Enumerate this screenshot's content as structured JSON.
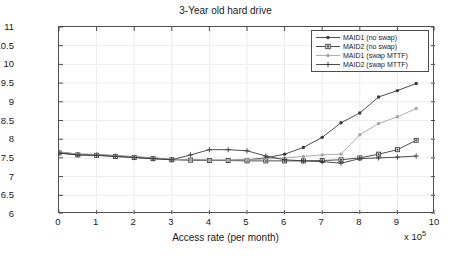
{
  "chart_data": {
    "type": "line",
    "title": "3-Year old hard drive",
    "xlabel": "Access rate (per month)",
    "ylabel": "AFR (%)",
    "x_exponent": "x 10",
    "x_exponent_sup": "5",
    "xlim": [
      0,
      10
    ],
    "ylim": [
      6,
      11
    ],
    "xticks": [
      0,
      1,
      2,
      3,
      4,
      5,
      6,
      7,
      8,
      9,
      10
    ],
    "yticks": [
      6,
      6.5,
      7,
      7.5,
      8,
      8.5,
      9,
      9.5,
      10,
      10.5,
      11
    ],
    "grid": true,
    "legend_position": "top-right",
    "x": [
      0,
      0.5,
      1,
      1.5,
      2,
      2.5,
      3,
      3.5,
      4,
      4.5,
      5,
      5.5,
      6,
      6.5,
      7,
      7.5,
      8,
      8.5,
      9,
      9.5
    ],
    "series": [
      {
        "name": "MAID1 (no swap)",
        "marker": "dot",
        "color": "#3a3a3a",
        "values": [
          7.66,
          7.6,
          7.59,
          7.56,
          7.53,
          7.5,
          7.46,
          7.45,
          7.44,
          7.44,
          7.45,
          7.5,
          7.6,
          7.78,
          8.05,
          8.44,
          8.7,
          9.13,
          9.3,
          9.49
        ]
      },
      {
        "name": "MAID2 (no swap)",
        "marker": "square",
        "color": "#3a3a3a",
        "values": [
          7.63,
          7.58,
          7.57,
          7.54,
          7.51,
          7.48,
          7.45,
          7.44,
          7.43,
          7.43,
          7.42,
          7.42,
          7.42,
          7.42,
          7.43,
          7.45,
          7.5,
          7.6,
          7.72,
          7.97
        ]
      },
      {
        "name": "MAID1 (swap MTTF)",
        "marker": "dot-light",
        "color": "#a6a6a6",
        "values": [
          7.66,
          7.6,
          7.59,
          7.56,
          7.53,
          7.5,
          7.46,
          7.45,
          7.44,
          7.44,
          7.45,
          7.47,
          7.5,
          7.54,
          7.58,
          7.6,
          8.12,
          8.42,
          8.6,
          8.82
        ]
      },
      {
        "name": "MAID2 (swap MTTF)",
        "marker": "plus",
        "color": "#3a3a3a",
        "values": [
          7.63,
          7.58,
          7.57,
          7.54,
          7.51,
          7.48,
          7.45,
          7.58,
          7.72,
          7.72,
          7.69,
          7.55,
          7.45,
          7.42,
          7.4,
          7.36,
          7.48,
          7.5,
          7.52,
          7.55
        ]
      }
    ]
  }
}
